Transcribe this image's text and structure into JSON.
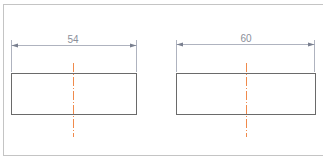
{
  "colors": {
    "frame": "#c4c4c4",
    "outline": "#6a6a6a",
    "dimension": "#9aa0ae",
    "dimension_text": "#8a8f9a",
    "center_line": "#f08a4b"
  },
  "drawings": [
    {
      "id": "left",
      "dimension_label": "54",
      "rect": {
        "x": 11,
        "y": 73,
        "w": 125,
        "h": 41
      },
      "dim_y": 45,
      "center_x": 73
    },
    {
      "id": "right",
      "dimension_label": "60",
      "rect": {
        "x": 176,
        "y": 73,
        "w": 139,
        "h": 41
      },
      "dim_y": 44,
      "center_x": 246
    }
  ]
}
